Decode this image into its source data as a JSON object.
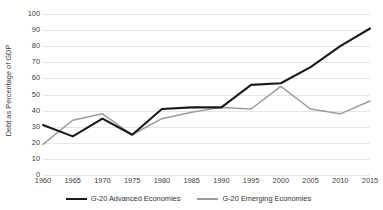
{
  "chart_data": {
    "type": "line",
    "title": "",
    "xlabel": "",
    "ylabel": "Debt as Percentage of GDP",
    "xlim": [
      1960,
      2015
    ],
    "ylim": [
      0,
      100
    ],
    "grid": true,
    "legend_position": "bottom",
    "x": [
      1960,
      1965,
      1970,
      1975,
      1980,
      1985,
      1990,
      1995,
      2000,
      2005,
      2010,
      2015
    ],
    "categories": [
      "1960",
      "1965",
      "1970",
      "1975",
      "1980",
      "1985",
      "1990",
      "1995",
      "2000",
      "2005",
      "2010",
      "2015"
    ],
    "xtick_labels": [
      "1960",
      "1965",
      "1970",
      "1975",
      "1980",
      "1985",
      "1990",
      "1995",
      "2000",
      "2005",
      "2010",
      "2015"
    ],
    "ytick_labels": [
      "0",
      "10",
      "20",
      "30",
      "40",
      "50",
      "60",
      "70",
      "80",
      "90",
      "100"
    ],
    "ytick_values": [
      0,
      10,
      20,
      30,
      40,
      50,
      60,
      70,
      80,
      90,
      100
    ],
    "series": [
      {
        "name": "G-20 Advanced Economies",
        "color": "#1a1a1a",
        "width": 2.1,
        "values": [
          31,
          24,
          35,
          25,
          41,
          42,
          42,
          56,
          57,
          67,
          80,
          91
        ]
      },
      {
        "name": "G-20 Emerging Economies",
        "color": "#9b9b9b",
        "width": 1.5,
        "values": [
          19,
          34,
          38,
          25,
          35,
          39,
          42,
          41,
          55,
          41,
          38,
          46
        ]
      }
    ]
  },
  "legend": {
    "entries": [
      {
        "label": "G-20 Advanced Economies",
        "color": "#1a1a1a"
      },
      {
        "label": "G-20 Emerging Economies",
        "color": "#9b9b9b"
      }
    ]
  }
}
